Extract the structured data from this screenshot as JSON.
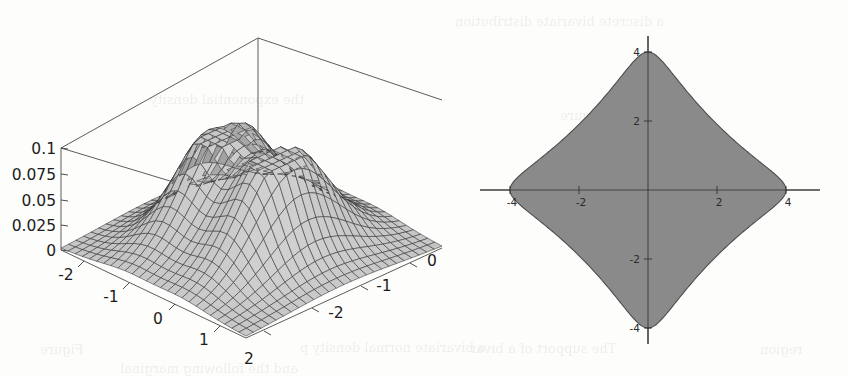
{
  "page": {
    "kind": "scanned-textbook-figure-pair",
    "background_color": "#fdfdfc",
    "ghost_text_color": "#5b5246"
  },
  "ghost_text": [
    {
      "text": "a discrete bivariate distribution",
      "x": 455,
      "y": 14
    },
    {
      "text": "the exponential density",
      "x": 150,
      "y": 92
    },
    {
      "text": "Figure",
      "x": 560,
      "y": 108
    },
    {
      "text": "a bivariate normal density p",
      "x": 300,
      "y": 340
    },
    {
      "text": "Figure",
      "x": 40,
      "y": 342
    },
    {
      "text": "The support of a bivar",
      "x": 470,
      "y": 341
    },
    {
      "text": "region",
      "x": 760,
      "y": 342
    },
    {
      "text": "and the following marginal",
      "x": 120,
      "y": 361
    }
  ],
  "figures": [
    {
      "id": "surface-plot-3d",
      "name": "3d-surface-plot",
      "type": "surface3d",
      "description": "Mathematica style wireframe surface in a bounding box"
    },
    {
      "id": "region-plot-2d",
      "name": "2d-region-plot",
      "type": "filled-region",
      "description": "Four pointed star shaped shaded support region"
    }
  ],
  "chart_data": [
    {
      "type": "surface",
      "id": "surface-plot-3d",
      "title": "",
      "xlabel": "",
      "ylabel": "",
      "zlabel": "",
      "xlim": [
        -2.5,
        2.5
      ],
      "ylim": [
        -2.5,
        2.5
      ],
      "zlim": [
        0,
        0.1
      ],
      "z_ticks": [
        "0.1",
        "0.075",
        "0.05",
        "0.025",
        "0"
      ],
      "z_tick_values": [
        0.1,
        0.075,
        0.05,
        0.025,
        0
      ],
      "x_ticks": [
        "-2",
        "-1",
        "0",
        "1",
        "2"
      ],
      "x_tick_values": [
        -2,
        -1,
        0,
        1,
        2
      ],
      "y_ticks": [
        "0",
        "-1",
        "-2"
      ],
      "y_tick_values": [
        0,
        -1,
        -2
      ],
      "grid": true,
      "mesh_u_divisions": 26,
      "mesh_v_divisions": 26,
      "surface_fill": "#9a9a9a",
      "mesh_color": "#2d2d2d",
      "box_color": "#4a4a4a",
      "peaks": [
        {
          "x": -0.75,
          "y": 0.0,
          "z": 0.1
        },
        {
          "x": 0.75,
          "y": 0.0,
          "z": 0.1
        }
      ],
      "saddle": {
        "x": 0.0,
        "y": 0.0,
        "z": 0.072
      },
      "notes": "bimodal bivariate density, two ridges separated by a central valley"
    },
    {
      "type": "filled-region",
      "id": "region-plot-2d",
      "title": "",
      "xlabel": "",
      "ylabel": "",
      "xlim": [
        -4.6,
        4.6
      ],
      "ylim": [
        -4.6,
        4.6
      ],
      "x_ticks": [
        "-4",
        "-2",
        "2",
        "4"
      ],
      "x_tick_values": [
        -4,
        -2,
        2,
        4
      ],
      "y_ticks": [
        "4",
        "2",
        "-2",
        "-4"
      ],
      "y_tick_values": [
        4,
        2,
        -2,
        -4
      ],
      "grid": false,
      "fill_color": "#8a8a8a",
      "outline_color": "#4c4c4c",
      "axis_color": "#2f2f2f",
      "boundary": "astroid-like star: |x|^(2/3) + |y|^(2/3) = 4^(2/3)",
      "vertices": [
        {
          "x": 4,
          "y": 0
        },
        {
          "x": 0,
          "y": 4
        },
        {
          "x": -4,
          "y": 0
        },
        {
          "x": 0,
          "y": -4
        }
      ]
    }
  ]
}
